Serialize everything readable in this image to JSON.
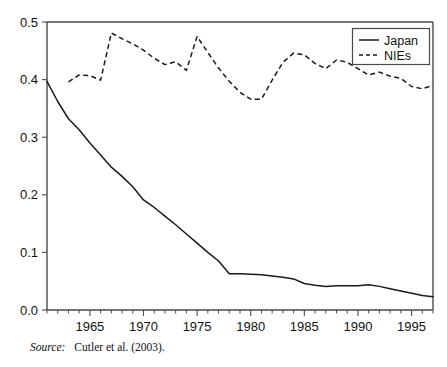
{
  "chart_data": {
    "type": "line",
    "title": "",
    "subtitle": "",
    "xlabel": "",
    "ylabel": "",
    "xlim": [
      1961,
      1997
    ],
    "ylim": [
      0.0,
      0.5
    ],
    "grid": false,
    "legend_position": "top-right",
    "x_ticks": [
      1965,
      1970,
      1975,
      1980,
      1985,
      1990,
      1995
    ],
    "x_tick_labels": [
      "1965",
      "1970",
      "1975",
      "1980",
      "1985",
      "1990",
      "1995"
    ],
    "x_minor_tick_step": 1,
    "y_ticks": [
      0.0,
      0.1,
      0.2,
      0.3,
      0.4,
      0.5
    ],
    "y_tick_labels": [
      "0.0",
      "0.1",
      "0.2",
      "0.3",
      "0.4",
      "0.5"
    ],
    "x": [
      1961,
      1962,
      1963,
      1964,
      1965,
      1966,
      1967,
      1968,
      1969,
      1970,
      1971,
      1972,
      1973,
      1974,
      1975,
      1976,
      1977,
      1978,
      1979,
      1980,
      1981,
      1982,
      1983,
      1984,
      1985,
      1986,
      1987,
      1988,
      1989,
      1990,
      1991,
      1992,
      1993,
      1994,
      1995,
      1996,
      1997
    ],
    "series": [
      {
        "name": "Japan",
        "style": "solid",
        "color": "#1a1a1a",
        "values": [
          0.397,
          0.362,
          0.332,
          0.313,
          0.29,
          0.269,
          0.248,
          0.232,
          0.214,
          0.191,
          0.178,
          0.163,
          0.148,
          0.132,
          0.116,
          0.1,
          0.085,
          0.063,
          0.063,
          0.062,
          0.061,
          0.059,
          0.057,
          0.054,
          0.046,
          0.043,
          0.041,
          0.042,
          0.042,
          0.042,
          0.044,
          0.041,
          0.037,
          0.033,
          0.029,
          0.025,
          0.023
        ]
      },
      {
        "name": "NIEs",
        "style": "dashed",
        "color": "#1a1a1a",
        "values": [
          null,
          null,
          0.396,
          0.408,
          0.407,
          0.399,
          0.481,
          0.471,
          0.462,
          0.451,
          0.437,
          0.426,
          0.431,
          0.416,
          0.475,
          0.45,
          0.425,
          0.4,
          0.378,
          0.366,
          0.366,
          0.399,
          0.43,
          0.446,
          0.443,
          0.43,
          0.417,
          0.434,
          0.43,
          0.418,
          0.41,
          0.407,
          0.404,
          0.401,
          0.41,
          0.404,
          0.394
        ]
      }
    ],
    "series_extended": {
      "note": "full NIEs trace including late-period decline",
      "nies_x": [
        1963,
        1964,
        1965,
        1966,
        1967,
        1968,
        1969,
        1970,
        1971,
        1972,
        1973,
        1974,
        1975,
        1976,
        1977,
        1978,
        1979,
        1980,
        1981,
        1982,
        1983,
        1984,
        1985,
        1986,
        1987,
        1988,
        1989,
        1990,
        1991,
        1992,
        1993,
        1994,
        1995,
        1996,
        1997
      ],
      "nies_y": [
        0.396,
        0.408,
        0.407,
        0.399,
        0.481,
        0.471,
        0.462,
        0.451,
        0.437,
        0.426,
        0.431,
        0.416,
        0.475,
        0.447,
        0.42,
        0.397,
        0.378,
        0.366,
        0.366,
        0.399,
        0.43,
        0.446,
        0.443,
        0.428,
        0.419,
        0.434,
        0.43,
        0.419,
        0.408,
        0.413,
        0.406,
        0.402,
        0.388,
        0.384,
        0.39
      ],
      "japan_x": [
        1961,
        1962,
        1963,
        1964,
        1965,
        1966,
        1967,
        1968,
        1969,
        1970,
        1971,
        1972,
        1973,
        1974,
        1975,
        1976,
        1977,
        1978,
        1979,
        1980,
        1981,
        1982,
        1983,
        1984,
        1985,
        1986,
        1987,
        1988,
        1989,
        1990,
        1991,
        1992,
        1993,
        1994,
        1995,
        1996,
        1997
      ],
      "japan_y": [
        0.397,
        0.362,
        0.332,
        0.313,
        0.29,
        0.269,
        0.248,
        0.232,
        0.214,
        0.191,
        0.178,
        0.163,
        0.148,
        0.132,
        0.116,
        0.1,
        0.085,
        0.063,
        0.063,
        0.062,
        0.061,
        0.059,
        0.057,
        0.054,
        0.046,
        0.043,
        0.041,
        0.042,
        0.042,
        0.042,
        0.044,
        0.041,
        0.037,
        0.033,
        0.029,
        0.025,
        0.023
      ]
    },
    "annotations": []
  },
  "legend": {
    "items": [
      {
        "label": "Japan",
        "style": "solid"
      },
      {
        "label": "NIEs",
        "style": "dashed"
      }
    ]
  },
  "source": {
    "label": "Source:",
    "text": "Cutler et al. (2003)."
  },
  "colors": {
    "line": "#1a1a1a",
    "axis": "#4a4a4a",
    "background": "#ffffff",
    "text": "#111111"
  }
}
